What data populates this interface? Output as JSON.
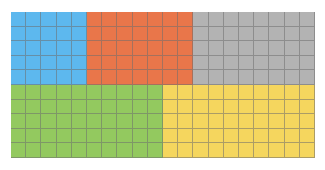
{
  "chart_data": {
    "type": "waffle",
    "title": "",
    "grid": {
      "columns": 20,
      "rows": 10,
      "total_cells": 200
    },
    "series": [
      {
        "name": "blue",
        "color": "#5db8ee",
        "cells": 25,
        "share": 0.125,
        "region": {
          "col_start": 0,
          "col_end": 5,
          "row_start": 0,
          "row_end": 5
        }
      },
      {
        "name": "orange",
        "color": "#e9764a",
        "cells": 35,
        "share": 0.175,
        "region": {
          "col_start": 5,
          "col_end": 12,
          "row_start": 0,
          "row_end": 5
        }
      },
      {
        "name": "gray",
        "color": "#b3b3b3",
        "cells": 40,
        "share": 0.2,
        "region": {
          "col_start": 12,
          "col_end": 20,
          "row_start": 0,
          "row_end": 5
        }
      },
      {
        "name": "green",
        "color": "#93c95f",
        "cells": 50,
        "share": 0.25,
        "region": {
          "col_start": 0,
          "col_end": 10,
          "row_start": 5,
          "row_end": 10
        }
      },
      {
        "name": "yellow",
        "color": "#f5d65e",
        "cells": 50,
        "share": 0.25,
        "region": {
          "col_start": 10,
          "col_end": 20,
          "row_start": 5,
          "row_end": 10
        }
      }
    ],
    "legend": null,
    "axes": null
  }
}
